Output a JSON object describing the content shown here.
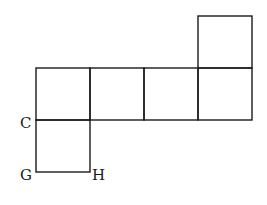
{
  "diagram": {
    "type": "cube-net",
    "squares": 6,
    "labels": {
      "c": "C",
      "g": "G",
      "h": "H"
    },
    "stroke_color": "#1a1a1a",
    "background": "#ffffff"
  }
}
